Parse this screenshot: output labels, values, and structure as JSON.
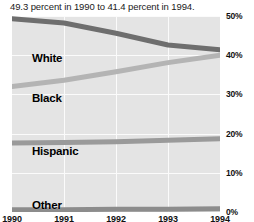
{
  "caption": "49.3 percent in 1990 to 41.4 percent in 1994.",
  "chart_data": {
    "type": "line",
    "title": "",
    "xlabel": "",
    "ylabel": "",
    "x": [
      "1990",
      "1991",
      "1992",
      "1993",
      "1994"
    ],
    "ylim": [
      0,
      50
    ],
    "yticks": [
      "0%",
      "10%",
      "20%",
      "30%",
      "40%",
      "50%"
    ],
    "ytick_values": [
      0,
      10,
      20,
      30,
      40,
      50
    ],
    "grid": true,
    "legend": "inline-labels",
    "series": [
      {
        "name": "White",
        "color": "#6e6e6e",
        "values": [
          49.3,
          48.2,
          45.6,
          42.6,
          41.4
        ],
        "label_x": 20,
        "label_y": 36
      },
      {
        "name": "Black",
        "color": "#b4b4b4",
        "values": [
          32.0,
          33.6,
          35.8,
          38.1,
          40.0
        ],
        "label_x": 20,
        "label_y": 76
      },
      {
        "name": "Hispanic",
        "color": "#9a9a9a",
        "values": [
          17.6,
          17.7,
          17.9,
          18.3,
          18.7
        ],
        "label_x": 20,
        "label_y": 129
      },
      {
        "name": "Other",
        "color": "#8c8c8c",
        "values": [
          0.6,
          0.6,
          0.7,
          0.7,
          0.8
        ],
        "label_x": 20,
        "label_y": 183
      }
    ]
  }
}
